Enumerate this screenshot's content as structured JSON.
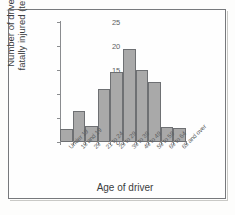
{
  "chart_data": {
    "type": "bar",
    "title": "",
    "xlabel": "Age of driver",
    "ylabel": "Number of drivers fatally injured (tens)",
    "ylabel_line1": "Number of drivers",
    "ylabel_line2": "fatally injured (tens)",
    "categories": [
      "Under 19",
      "18 and 19",
      "20",
      "21 to 24",
      "25 to 29",
      "30 to 39",
      "40 to 49",
      "50 to 59",
      "60 to 64",
      "65 and over"
    ],
    "values": [
      2.7,
      6.5,
      3.4,
      11.0,
      14.5,
      19.3,
      15.0,
      12.6,
      3.2,
      3.0
    ],
    "ylim": [
      0,
      25
    ],
    "yticks": [
      0,
      5,
      10,
      15,
      20,
      25
    ],
    "ytick_labels": [
      "0",
      "5",
      "10",
      "15",
      "20",
      "25"
    ],
    "grid": false,
    "legend": "none",
    "bar_fill_color": "#a9a9a9",
    "bar_edge_color": "#6e7073",
    "axis_color": "#8a8c8f",
    "text_color": "#3b3d40"
  }
}
